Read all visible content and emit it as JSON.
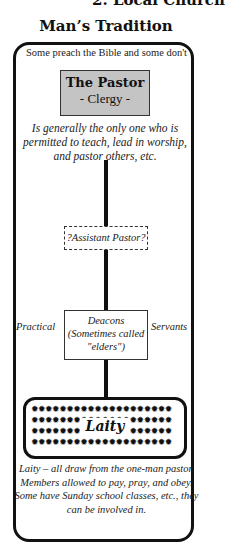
{
  "page": {
    "top_heading": "2. Local Church",
    "title": "Man’s Tradition"
  },
  "diagram": {
    "subtitle": "Some preach the Bible and some don't",
    "pastor": {
      "title": "The Pastor",
      "subtitle": "- Clergy -",
      "description": "Is generally the only one who is permitted to teach, lead in worship, and pastor others, etc."
    },
    "assistant": {
      "label": "?Assistant Pastor?"
    },
    "deacons": {
      "line1": "Deacons",
      "line2": "(Sometimes called",
      "line3": "\"elders\")",
      "left_label": "Practical",
      "right_label": "Servants"
    },
    "laity": {
      "label": "Laity",
      "dot_row_full": "✹✹✹✹✹✹✹✹✹✹✹✹✹✹✹✹✹✹✹✹",
      "description": "Laity – all draw from the one-man pastor. Members allowed to pay, pray, and obey. Some have Sunday school classes, etc., they can be involved in."
    }
  }
}
